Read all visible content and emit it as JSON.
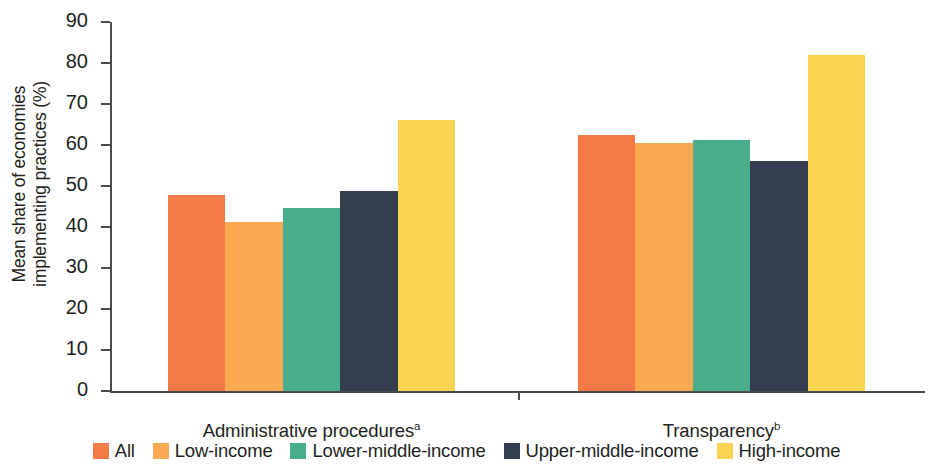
{
  "chart_data": {
    "type": "bar",
    "title": "",
    "subtitle": "",
    "xlabel": "",
    "ylabel": "Mean share of economies\nimplementing practices (%)",
    "categories": [
      "Administrative procedures",
      "Transparency"
    ],
    "category_superscripts": [
      "a",
      "b"
    ],
    "ylim": [
      0,
      90
    ],
    "ytick_labels": [
      "0",
      "10",
      "20",
      "30",
      "40",
      "50",
      "60",
      "70",
      "80",
      "90"
    ],
    "ytick_values": [
      0,
      10,
      20,
      30,
      40,
      50,
      60,
      70,
      80,
      90
    ],
    "grid": false,
    "legend_position": "bottom",
    "series": [
      {
        "name": "All",
        "color": "#F47B45",
        "values": [
          47.7,
          62.5
        ]
      },
      {
        "name": "Low-income",
        "color": "#F9A94F",
        "values": [
          41.2,
          60.4
        ]
      },
      {
        "name": "Lower-middle-income",
        "color": "#49AE8D",
        "values": [
          44.6,
          61.2
        ]
      },
      {
        "name": "Upper-middle-income",
        "color": "#333F4F",
        "values": [
          48.9,
          56.0
        ]
      },
      {
        "name": "High-income",
        "color": "#F8D451",
        "values": [
          66.1,
          82.0
        ]
      }
    ]
  }
}
